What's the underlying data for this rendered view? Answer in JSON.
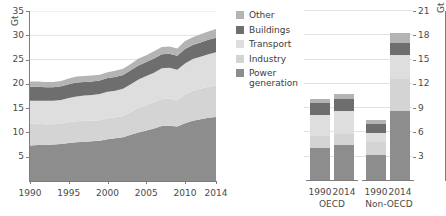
{
  "chart_data": [
    {
      "type": "area",
      "panel": "left",
      "title": "",
      "xlabel": "",
      "ylabel": "Gt",
      "ylim": [
        0,
        35
      ],
      "yticks": [
        5,
        10,
        15,
        20,
        25,
        30,
        35
      ],
      "xticks": [
        1990,
        1995,
        2000,
        2005,
        2010,
        2014
      ],
      "xlim": [
        1990,
        2014
      ],
      "grid": true,
      "legend_position": "right",
      "stacked": true,
      "x": [
        1990,
        1991,
        1992,
        1993,
        1994,
        1995,
        1996,
        1997,
        1998,
        1999,
        2000,
        2001,
        2002,
        2003,
        2004,
        2005,
        2006,
        2007,
        2008,
        2009,
        2010,
        2011,
        2012,
        2013,
        2014
      ],
      "series": [
        {
          "name": "Power generation",
          "color": "#8d8d8d",
          "values": [
            7.3,
            7.4,
            7.4,
            7.5,
            7.6,
            7.8,
            8.0,
            8.1,
            8.2,
            8.3,
            8.6,
            8.8,
            9.0,
            9.5,
            10.0,
            10.4,
            10.8,
            11.3,
            11.4,
            11.2,
            11.9,
            12.4,
            12.7,
            13.0,
            13.2
          ]
        },
        {
          "name": "Industry",
          "color": "#d4d4d4",
          "values": [
            4.5,
            4.4,
            4.3,
            4.2,
            4.2,
            4.3,
            4.3,
            4.3,
            4.2,
            4.2,
            4.3,
            4.3,
            4.4,
            4.7,
            5.0,
            5.2,
            5.4,
            5.6,
            5.6,
            5.4,
            5.9,
            6.2,
            6.3,
            6.4,
            6.5
          ]
        },
        {
          "name": "Transport",
          "color": "#dedede",
          "values": [
            4.7,
            4.7,
            4.8,
            4.8,
            4.9,
            5.0,
            5.1,
            5.2,
            5.3,
            5.4,
            5.5,
            5.5,
            5.6,
            5.7,
            5.9,
            6.0,
            6.1,
            6.3,
            6.3,
            6.3,
            6.4,
            6.5,
            6.6,
            6.7,
            6.8
          ]
        },
        {
          "name": "Buildings",
          "color": "#6e6e6e",
          "values": [
            2.9,
            2.9,
            2.8,
            2.8,
            2.8,
            2.8,
            2.9,
            2.8,
            2.8,
            2.8,
            2.8,
            2.8,
            2.8,
            2.9,
            2.9,
            2.9,
            2.9,
            2.9,
            2.9,
            2.9,
            3.0,
            2.9,
            2.9,
            3.0,
            3.0
          ]
        },
        {
          "name": "Other",
          "color": "#b4b4b4",
          "values": [
            1.1,
            1.1,
            1.1,
            1.1,
            1.1,
            1.2,
            1.2,
            1.2,
            1.2,
            1.2,
            1.2,
            1.3,
            1.3,
            1.3,
            1.4,
            1.4,
            1.5,
            1.5,
            1.5,
            1.5,
            1.6,
            1.6,
            1.7,
            1.7,
            1.8
          ]
        }
      ],
      "totals": [
        20.5,
        20.5,
        20.4,
        20.4,
        20.6,
        21.1,
        21.5,
        21.6,
        21.7,
        21.9,
        22.4,
        22.7,
        23.1,
        24.1,
        25.2,
        25.9,
        26.7,
        27.6,
        27.7,
        27.3,
        28.8,
        29.6,
        30.2,
        30.8,
        31.3
      ]
    },
    {
      "type": "bar",
      "panel": "right",
      "title": "",
      "xlabel": "",
      "ylabel": "Gt",
      "ylim": [
        0,
        21
      ],
      "yticks": [
        3,
        6,
        9,
        12,
        15,
        18,
        21
      ],
      "grid": true,
      "stacked": true,
      "categories": [
        "1990",
        "2014",
        "1990",
        "2014"
      ],
      "groups": [
        {
          "label": "OECD",
          "categories": [
            "1990",
            "2014"
          ]
        },
        {
          "label": "Non-OECD",
          "categories": [
            "1990",
            "2014"
          ]
        }
      ],
      "series": [
        {
          "name": "Power generation",
          "color": "#8d8d8d",
          "values": [
            4.1,
            4.5,
            3.2,
            8.7
          ]
        },
        {
          "name": "Industry",
          "color": "#d4d4d4",
          "values": [
            1.5,
            1.3,
            1.6,
            3.9
          ]
        },
        {
          "name": "Transport",
          "color": "#dedede",
          "values": [
            2.5,
            2.8,
            1.1,
            3.0
          ]
        },
        {
          "name": "Buildings",
          "color": "#6e6e6e",
          "values": [
            1.5,
            1.5,
            1.1,
            1.5
          ]
        },
        {
          "name": "Other",
          "color": "#b4b4b4",
          "values": [
            0.5,
            0.6,
            0.5,
            1.2
          ]
        }
      ],
      "totals": [
        10.1,
        10.7,
        7.5,
        18.3
      ]
    }
  ],
  "left_axis": {
    "unit": "Gt",
    "yticks": [
      "5",
      "10",
      "15",
      "20",
      "25",
      "30",
      "35"
    ],
    "xticks": [
      "1990",
      "1995",
      "2000",
      "2005",
      "2010",
      "2014"
    ]
  },
  "right_axis": {
    "unit": "Gt",
    "yticks": [
      "3",
      "6",
      "9",
      "12",
      "15",
      "18",
      "21"
    ]
  },
  "legend": {
    "items": [
      {
        "label": "Other",
        "color": "#b4b4b4"
      },
      {
        "label": "Buildings",
        "color": "#6e6e6e"
      },
      {
        "label": "Transport",
        "color": "#dedede"
      },
      {
        "label": "Industry",
        "color": "#d4d4d4"
      },
      {
        "label": "Power generation",
        "color": "#8d8d8d"
      }
    ]
  },
  "bar_labels": {
    "bars": [
      "1990",
      "2014",
      "1990",
      "2014"
    ],
    "groups": [
      "OECD",
      "Non-OECD"
    ]
  }
}
